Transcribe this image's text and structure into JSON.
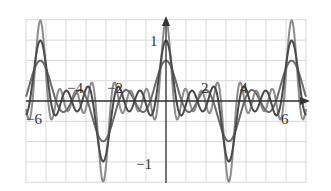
{
  "chart_data": {
    "type": "line",
    "title": "",
    "xlabel": "",
    "ylabel": "",
    "xlim": [
      -7,
      7
    ],
    "ylim": [
      -1.33,
      1.33
    ],
    "grid": true,
    "grid_x_step": 1,
    "grid_y_step": 0.3333,
    "x_tick_labels": [
      {
        "value": -6,
        "label": "−6"
      },
      {
        "value": -4,
        "label": "−4"
      },
      {
        "value": -2,
        "label": "−2"
      },
      {
        "value": 2,
        "label": "2"
      },
      {
        "value": 4,
        "label": "4"
      },
      {
        "value": 6,
        "label": "6"
      }
    ],
    "y_tick_labels": [
      {
        "value": 1,
        "label": "1"
      },
      {
        "value": -1,
        "label": "−1"
      }
    ],
    "series": [
      {
        "name": "partial sum (2 terms)",
        "terms": 2,
        "peak": 0.67,
        "trough": -0.67,
        "color": "#6b6b6b"
      },
      {
        "name": "partial sum (3 terms)",
        "terms": 3,
        "peak": 1.0,
        "trough": -1.0,
        "color": "#4a4a4a"
      },
      {
        "name": "partial sum (4 terms)",
        "terms": 4,
        "peak": 1.33,
        "trough": -1.33,
        "color": "#8c8c8c"
      }
    ],
    "sample_points": {
      "x": [
        -7,
        -6.28,
        -4.71,
        -3.14,
        -1.57,
        0,
        1.57,
        3.14,
        4.71,
        6.28,
        7
      ],
      "partial_sum_2": [
        0.5,
        0.67,
        0,
        -0.67,
        0,
        0.67,
        0,
        -0.67,
        0,
        0.67,
        0.5
      ],
      "partial_sum_3": [
        0.45,
        1.0,
        0,
        -1.0,
        0,
        1.0,
        0,
        -1.0,
        0,
        1.0,
        0.45
      ],
      "partial_sum_4": [
        0.4,
        1.33,
        0,
        -1.33,
        0,
        1.33,
        0,
        -1.33,
        0,
        1.33,
        0.4
      ]
    }
  },
  "colors": {
    "grid": "#d9d9d9",
    "axis": "#333333",
    "label": "#333333"
  }
}
